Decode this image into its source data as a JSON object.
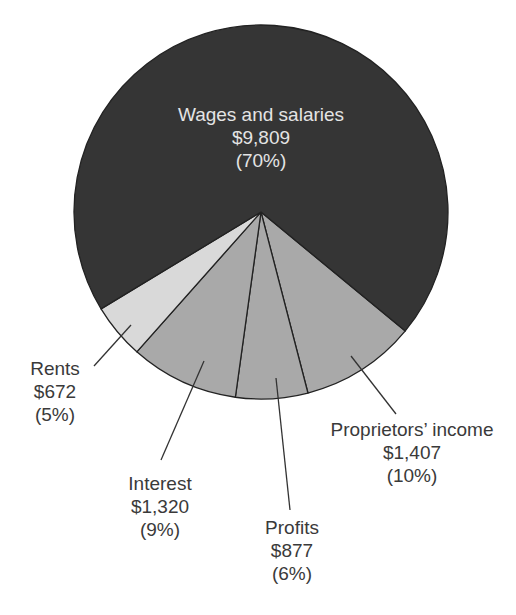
{
  "chart_data": {
    "type": "pie",
    "title": "",
    "total": 14085,
    "unit": "$",
    "slices": [
      {
        "key": "wages",
        "label": "Wages and salaries",
        "value": 9809,
        "value_label": "$9,809",
        "percent": 70,
        "percent_label": "(70%)",
        "color": "#353535"
      },
      {
        "key": "proprietors",
        "label": "Proprietors’ income",
        "value": 1407,
        "value_label": "$1,407",
        "percent": 10,
        "percent_label": "(10%)",
        "color": "#a9a9a9"
      },
      {
        "key": "profits",
        "label": "Profits",
        "value": 877,
        "value_label": "$877",
        "percent": 6,
        "percent_label": "(6%)",
        "color": "#a9a9a9"
      },
      {
        "key": "interest",
        "label": "Interest",
        "value": 1320,
        "value_label": "$1,320",
        "percent": 9,
        "percent_label": "(9%)",
        "color": "#a9a9a9"
      },
      {
        "key": "rents",
        "label": "Rents",
        "value": 672,
        "value_label": "$672",
        "percent": 5,
        "percent_label": "(5%)",
        "color": "#d9d9d9"
      }
    ],
    "legend": "none (direct labels with leader lines)"
  },
  "labels": {
    "wages": {
      "name": "Wages and salaries",
      "value": "$9,809",
      "percent": "(70%)"
    },
    "rents": {
      "name": "Rents",
      "value": "$672",
      "percent": "(5%)"
    },
    "interest": {
      "name": "Interest",
      "value": "$1,320",
      "percent": "(9%)"
    },
    "profits": {
      "name": "Profits",
      "value": "$877",
      "percent": "(6%)"
    },
    "proprietors": {
      "name": "Proprietors’ income",
      "value": "$1,407",
      "percent": "(10%)"
    }
  }
}
